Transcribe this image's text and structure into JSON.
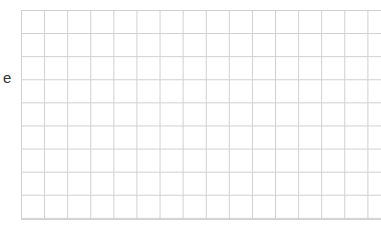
{
  "edge_text": {
    "visible_fragment": "e"
  },
  "grid": {
    "line_color": "#cdcdcd",
    "cell_size_px": 23,
    "columns_visible": 15,
    "rows_visible": 9
  }
}
